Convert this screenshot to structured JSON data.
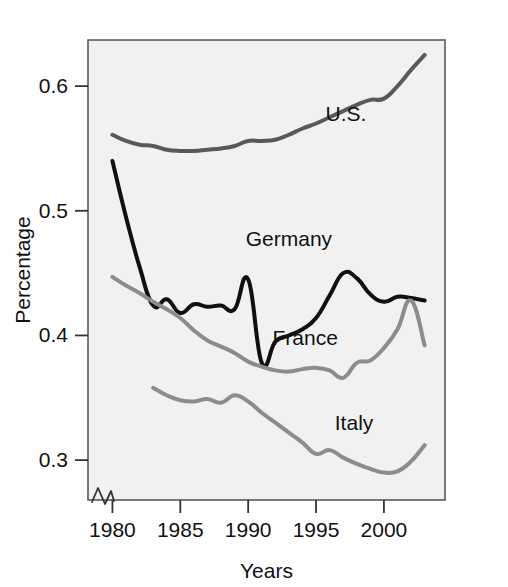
{
  "chart_data": {
    "type": "line",
    "title": "",
    "xlabel": "Years",
    "ylabel": "Percentage",
    "xlim": [
      1978.2,
      2004.5
    ],
    "ylim": [
      0.268,
      0.637
    ],
    "grid": false,
    "legend_position": "inline-annotations",
    "axis_break": "x-axis origin break",
    "xticks": [
      1980,
      1985,
      1990,
      1995,
      2000
    ],
    "xtick_labels": [
      "1980",
      "1985",
      "1990",
      "1995",
      "2000"
    ],
    "yticks": [
      0.3,
      0.4,
      0.5,
      0.6
    ],
    "ytick_labels": [
      "0.3",
      "0.4",
      "0.5",
      "0.6"
    ],
    "background_color": "#f1f1f1",
    "frame_color": "#5a5a5a",
    "series": [
      {
        "name": "U.S.",
        "color": "#595959",
        "width": 4.0,
        "label_x": 1997.2,
        "label_y": 0.572,
        "x": [
          1980,
          1981,
          1982,
          1983,
          1984,
          1985,
          1986,
          1987,
          1988,
          1989,
          1990,
          1991,
          1992,
          1993,
          1994,
          1995,
          1996,
          1997,
          1998,
          1999,
          2000,
          2001,
          2002,
          2003
        ],
        "values": [
          0.561,
          0.556,
          0.553,
          0.552,
          0.549,
          0.548,
          0.548,
          0.549,
          0.55,
          0.552,
          0.556,
          0.556,
          0.557,
          0.561,
          0.566,
          0.57,
          0.575,
          0.58,
          0.585,
          0.589,
          0.59,
          0.6,
          0.613,
          0.625
        ]
      },
      {
        "name": "Germany",
        "color": "#101010",
        "width": 4.0,
        "label_x": 1993.0,
        "label_y": 0.472,
        "x": [
          1980,
          1981,
          1982,
          1983,
          1984,
          1985,
          1986,
          1987,
          1988,
          1989,
          1990,
          1991,
          1992,
          1993,
          1994,
          1995,
          1996,
          1997,
          1998,
          1999,
          2000,
          2001,
          2002,
          2003
        ],
        "values": [
          0.54,
          0.495,
          0.455,
          0.424,
          0.429,
          0.418,
          0.425,
          0.423,
          0.424,
          0.421,
          0.445,
          0.378,
          0.395,
          0.4,
          0.405,
          0.414,
          0.432,
          0.45,
          0.446,
          0.433,
          0.427,
          0.431,
          0.43,
          0.428
        ]
      },
      {
        "name": "France",
        "color": "#8c8c8c",
        "width": 4.0,
        "label_x": 1994.2,
        "label_y": 0.392,
        "x": [
          1980,
          1981,
          1982,
          1983,
          1984,
          1985,
          1986,
          1987,
          1988,
          1989,
          1990,
          1991,
          1992,
          1993,
          1994,
          1995,
          1996,
          1997,
          1998,
          1999,
          2000,
          2001,
          2002,
          2003
        ],
        "values": [
          0.447,
          0.44,
          0.434,
          0.427,
          0.421,
          0.414,
          0.404,
          0.396,
          0.391,
          0.386,
          0.379,
          0.375,
          0.372,
          0.371,
          0.373,
          0.374,
          0.372,
          0.366,
          0.378,
          0.38,
          0.39,
          0.405,
          0.428,
          0.392
        ]
      },
      {
        "name": "Italy",
        "color": "#8c8c8c",
        "width": 4.0,
        "label_x": 1997.8,
        "label_y": 0.324,
        "x": [
          1983,
          1984,
          1985,
          1986,
          1987,
          1988,
          1989,
          1990,
          1991,
          1992,
          1993,
          1994,
          1995,
          1996,
          1997,
          1998,
          1999,
          2000,
          2001,
          2002,
          2003
        ],
        "values": [
          0.358,
          0.352,
          0.348,
          0.347,
          0.349,
          0.346,
          0.352,
          0.347,
          0.338,
          0.33,
          0.322,
          0.314,
          0.305,
          0.308,
          0.302,
          0.297,
          0.293,
          0.29,
          0.291,
          0.299,
          0.312
        ]
      }
    ]
  }
}
